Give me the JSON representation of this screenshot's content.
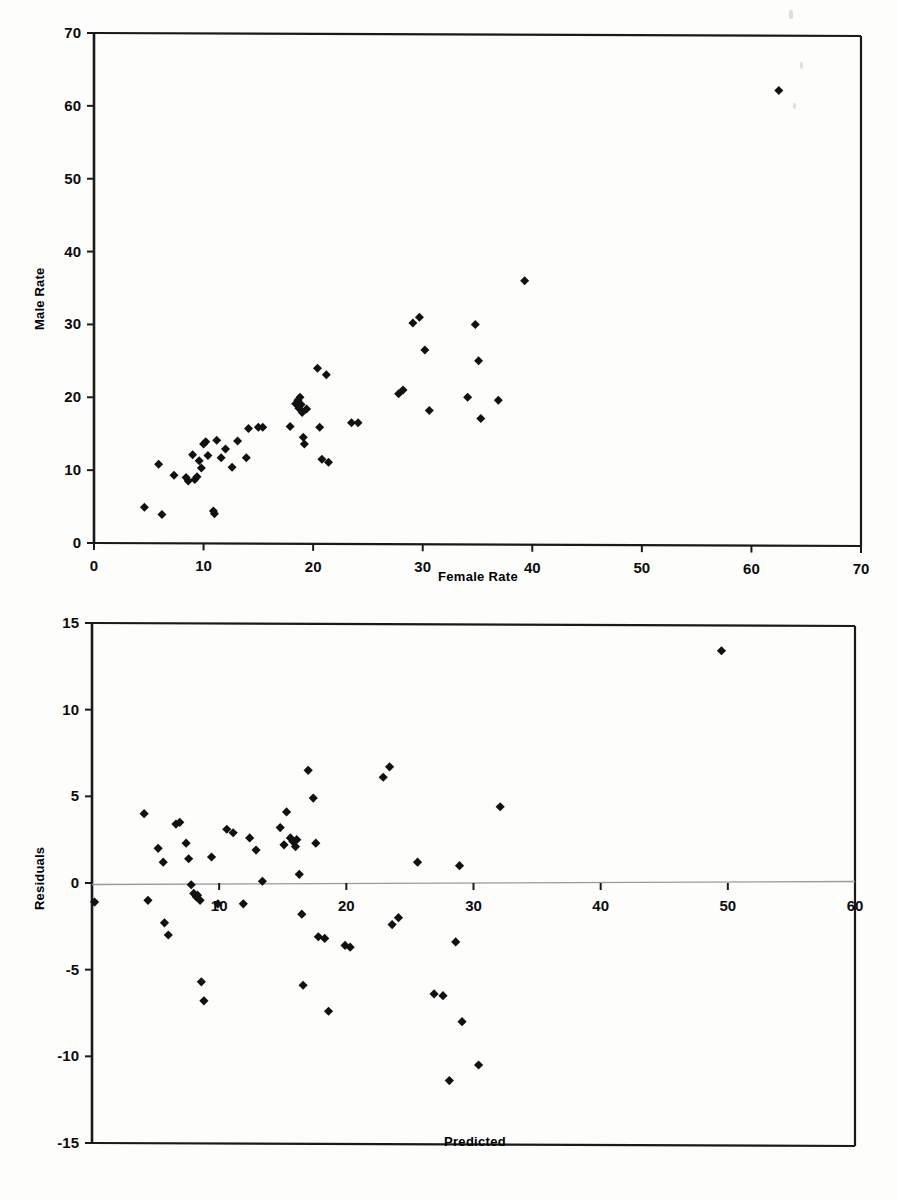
{
  "document": {
    "kind": "scanned-figure-page",
    "background_color": "#fdfdfc",
    "ink_color": "#000000"
  },
  "chart_data": [
    {
      "id": "male-vs-female-rate-scatter",
      "type": "scatter",
      "title": "",
      "xlabel": "Female Rate",
      "ylabel": "Male Rate",
      "xlim": [
        0,
        70
      ],
      "ylim": [
        0,
        70
      ],
      "xticks": [
        0,
        10,
        20,
        30,
        40,
        50,
        60,
        70
      ],
      "yticks": [
        0,
        10,
        20,
        30,
        40,
        50,
        60,
        70
      ],
      "xtick_labels": [
        "0",
        "10",
        "20",
        "30",
        "40",
        "50",
        "60",
        "70"
      ],
      "ytick_labels": [
        "0",
        "10",
        "20",
        "30",
        "40",
        "50",
        "60",
        "70"
      ],
      "grid": false,
      "legend": false,
      "marker": "diamond",
      "marker_color": "#000000",
      "points": [
        [
          4.6,
          4.9
        ],
        [
          5.9,
          10.8
        ],
        [
          6.2,
          3.9
        ],
        [
          7.3,
          9.3
        ],
        [
          8.4,
          9.0
        ],
        [
          8.6,
          8.5
        ],
        [
          9.0,
          12.1
        ],
        [
          9.2,
          8.7
        ],
        [
          9.4,
          9.1
        ],
        [
          9.6,
          11.3
        ],
        [
          9.8,
          10.3
        ],
        [
          10.0,
          13.6
        ],
        [
          10.2,
          13.9
        ],
        [
          10.4,
          12.0
        ],
        [
          10.9,
          4.4
        ],
        [
          11.0,
          4.0
        ],
        [
          11.2,
          14.1
        ],
        [
          11.6,
          11.7
        ],
        [
          12.0,
          12.9
        ],
        [
          12.6,
          10.4
        ],
        [
          13.1,
          14.0
        ],
        [
          13.9,
          11.7
        ],
        [
          14.1,
          15.7
        ],
        [
          15.0,
          15.9
        ],
        [
          15.4,
          15.9
        ],
        [
          17.9,
          16.0
        ],
        [
          18.4,
          19.1
        ],
        [
          18.6,
          19.6
        ],
        [
          18.7,
          18.5
        ],
        [
          18.8,
          20.0
        ],
        [
          18.9,
          19.0
        ],
        [
          19.0,
          17.9
        ],
        [
          19.1,
          14.5
        ],
        [
          19.2,
          13.6
        ],
        [
          19.4,
          18.4
        ],
        [
          20.4,
          24.0
        ],
        [
          20.6,
          15.9
        ],
        [
          20.8,
          11.5
        ],
        [
          21.2,
          23.1
        ],
        [
          21.4,
          11.1
        ],
        [
          23.5,
          16.5
        ],
        [
          24.1,
          16.5
        ],
        [
          27.8,
          20.5
        ],
        [
          28.2,
          21.0
        ],
        [
          29.1,
          30.2
        ],
        [
          29.7,
          31.0
        ],
        [
          30.2,
          26.5
        ],
        [
          30.6,
          18.2
        ],
        [
          34.1,
          20.0
        ],
        [
          34.8,
          30.0
        ],
        [
          35.1,
          25.0
        ],
        [
          35.3,
          17.1
        ],
        [
          36.9,
          19.6
        ],
        [
          39.3,
          36.0
        ],
        [
          62.5,
          62.1
        ]
      ]
    },
    {
      "id": "residuals-vs-predicted-scatter",
      "type": "scatter",
      "title": "",
      "xlabel": "Predicted",
      "ylabel": "Residuals",
      "xlim": [
        0,
        60
      ],
      "ylim": [
        -15,
        15
      ],
      "xticks": [
        10,
        20,
        30,
        40,
        50,
        60
      ],
      "yticks": [
        -15,
        -10,
        -5,
        0,
        5,
        10,
        15
      ],
      "xtick_labels": [
        "10",
        "20",
        "30",
        "40",
        "50",
        "60"
      ],
      "ytick_labels": [
        "-15",
        "-10",
        "-5",
        "0",
        "5",
        "10",
        "15"
      ],
      "grid": false,
      "legend": false,
      "zero_line": true,
      "zero_line_color": "#9a9a9a",
      "marker": "diamond",
      "marker_color": "#000000",
      "points": [
        [
          0.2,
          -1.1
        ],
        [
          4.1,
          4.0
        ],
        [
          4.4,
          -1.0
        ],
        [
          5.2,
          2.0
        ],
        [
          5.6,
          1.2
        ],
        [
          5.7,
          -2.3
        ],
        [
          6.0,
          -3.0
        ],
        [
          6.6,
          3.4
        ],
        [
          6.9,
          3.5
        ],
        [
          7.4,
          2.3
        ],
        [
          7.6,
          1.4
        ],
        [
          7.8,
          -0.1
        ],
        [
          8.0,
          -0.6
        ],
        [
          8.2,
          -0.8
        ],
        [
          8.3,
          -0.7
        ],
        [
          8.5,
          -1.0
        ],
        [
          8.6,
          -5.7
        ],
        [
          8.8,
          -6.8
        ],
        [
          9.4,
          1.5
        ],
        [
          9.9,
          -1.2
        ],
        [
          10.6,
          3.1
        ],
        [
          11.1,
          2.9
        ],
        [
          11.9,
          -1.2
        ],
        [
          12.4,
          2.6
        ],
        [
          12.9,
          1.9
        ],
        [
          13.4,
          0.1
        ],
        [
          14.8,
          3.2
        ],
        [
          15.1,
          2.2
        ],
        [
          15.3,
          4.1
        ],
        [
          15.6,
          2.6
        ],
        [
          15.8,
          2.4
        ],
        [
          16.0,
          2.1
        ],
        [
          16.1,
          2.5
        ],
        [
          16.3,
          0.5
        ],
        [
          16.5,
          -1.8
        ],
        [
          16.6,
          -5.9
        ],
        [
          17.0,
          6.5
        ],
        [
          17.4,
          4.9
        ],
        [
          17.6,
          2.3
        ],
        [
          17.8,
          -3.1
        ],
        [
          18.3,
          -3.2
        ],
        [
          18.6,
          -7.4
        ],
        [
          19.9,
          -3.6
        ],
        [
          20.3,
          -3.7
        ],
        [
          22.9,
          6.1
        ],
        [
          23.4,
          6.7
        ],
        [
          23.6,
          -2.4
        ],
        [
          24.1,
          -2.0
        ],
        [
          25.6,
          1.2
        ],
        [
          26.9,
          -6.4
        ],
        [
          27.6,
          -6.5
        ],
        [
          28.1,
          -11.4
        ],
        [
          28.6,
          -3.4
        ],
        [
          28.9,
          1.0
        ],
        [
          29.1,
          -8.0
        ],
        [
          30.4,
          -10.5
        ],
        [
          32.1,
          4.4
        ],
        [
          49.5,
          13.4
        ]
      ]
    }
  ],
  "chart1_geometry": {
    "plot_left_px": 94,
    "plot_right_px": 861,
    "plot_top_px": 33,
    "plot_bottom_px": 543
  },
  "chart2_geometry": {
    "plot_left_px": 92,
    "plot_right_px": 855,
    "plot_top_px": 23,
    "plot_bottom_px": 543
  },
  "artifacts": [
    {
      "x": 789,
      "y": 10,
      "w": 4,
      "h": 9
    },
    {
      "x": 800,
      "y": 62,
      "w": 3,
      "h": 7
    },
    {
      "x": 793,
      "y": 103,
      "w": 3,
      "h": 6
    }
  ]
}
